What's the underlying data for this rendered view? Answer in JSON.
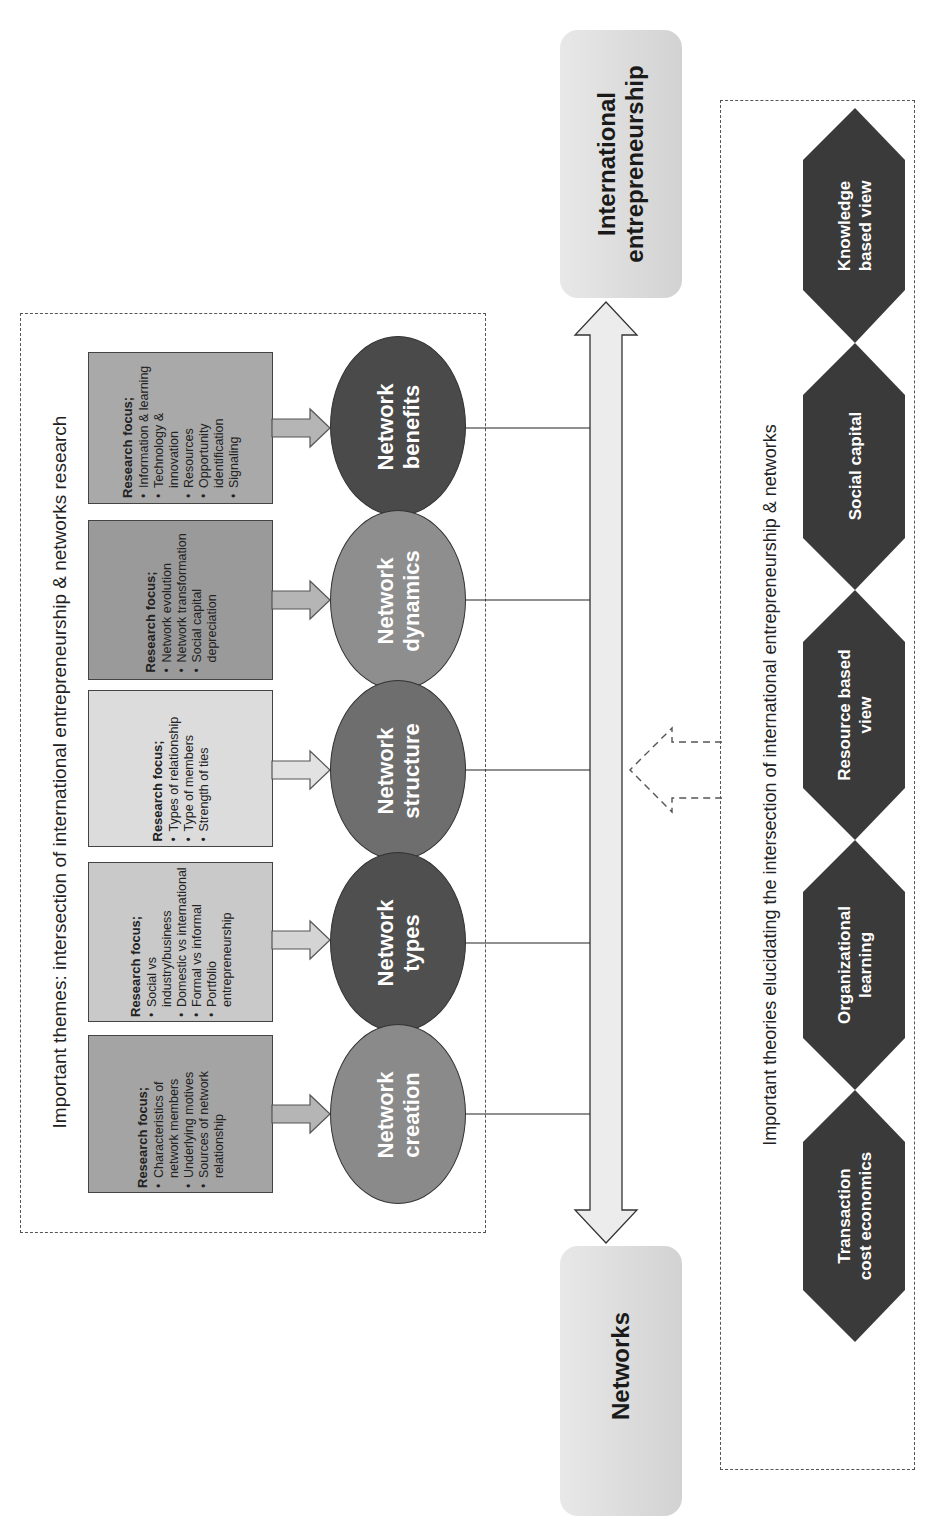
{
  "themes": {
    "title": "Important themes: intersection of international entrepreneurship & networks research",
    "items": [
      {
        "id": "benefits",
        "label": "Network benefits",
        "label_lines": [
          "Network",
          "benefits"
        ],
        "ellipse_color": "#4a4a4a",
        "box_color": "#a9a9a9",
        "focus_heading": "Research focus;",
        "focus_items": [
          "Information & learning",
          "Technology & innovation",
          "Resources",
          "Opportunity identification",
          "Signaling"
        ]
      },
      {
        "id": "dynamics",
        "label": "Network dynamics",
        "label_lines": [
          "Network",
          "dynamics"
        ],
        "ellipse_color": "#8e8e8e",
        "box_color": "#9a9a9a",
        "focus_heading": "Research focus;",
        "focus_items": [
          "Network evolution",
          "Network transformation",
          "Social capital depreciation"
        ]
      },
      {
        "id": "structure",
        "label": "Network structure",
        "label_lines": [
          "Network",
          "structure"
        ],
        "ellipse_color": "#6e6e6e",
        "box_color": "#dcdcdc",
        "focus_heading": "Research focus;",
        "focus_items": [
          "Types of relationship",
          "Type of members",
          "Strength of ties"
        ]
      },
      {
        "id": "types",
        "label": "Network types",
        "label_lines": [
          "Network",
          "types"
        ],
        "ellipse_color": "#4f4f4f",
        "box_color": "#c9c9c9",
        "focus_heading": "Research focus;",
        "focus_items": [
          "Social vs industry/business",
          "Domestic vs international",
          "Formal vs informal",
          "Portfolio entrepreneurship"
        ]
      },
      {
        "id": "creation",
        "label": "Network creation",
        "label_lines": [
          "Network",
          "creation"
        ],
        "ellipse_color": "#8a8a8a",
        "box_color": "#a4a4a4",
        "focus_heading": "Research focus;",
        "focus_items": [
          "Characteristics of network members",
          "Underlying motives",
          "Sources of network relationship"
        ]
      }
    ]
  },
  "axis": {
    "top_label": "International entrepreneurship",
    "top_label_lines": [
      "International",
      "entrepreneurship"
    ],
    "bottom_label": "Networks"
  },
  "theories": {
    "title": "Important theories elucidating the intersection of international entrepreneurship & networks",
    "items": [
      {
        "label": "Knowledge based view",
        "lines": [
          "Knowledge",
          "based view"
        ]
      },
      {
        "label": "Social capital",
        "lines": [
          "Social capital"
        ]
      },
      {
        "label": "Resource based view",
        "lines": [
          "Resource based",
          "view"
        ]
      },
      {
        "label": "Organizational learning",
        "lines": [
          "Organizational",
          "learning"
        ]
      },
      {
        "label": "Transaction cost economics",
        "lines": [
          "Transaction",
          "cost economics"
        ]
      }
    ]
  },
  "colors": {
    "hexagon": "#3a3a3a",
    "axis_fill": "#e6e6e6",
    "dashed": "#555555"
  }
}
